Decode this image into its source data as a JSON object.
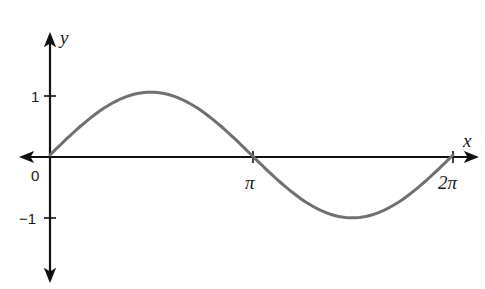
{
  "chart_data": {
    "type": "line",
    "title": "",
    "xlabel": "x",
    "ylabel": "y",
    "x_ticks": [
      {
        "value": 0,
        "label": "0"
      },
      {
        "value": 3.14159,
        "label": "π"
      },
      {
        "value": 6.28319,
        "label": "2π"
      }
    ],
    "y_ticks": [
      {
        "value": 1,
        "label": "1"
      },
      {
        "value": -1,
        "label": "−1"
      }
    ],
    "xlim": [
      0,
      6.28319
    ],
    "ylim": [
      -1.1,
      1.1
    ],
    "grid": false,
    "legend": null,
    "series": [
      {
        "name": "y = sin x",
        "color": "#707070",
        "x": [
          0,
          0.785,
          1.571,
          2.356,
          3.142,
          3.927,
          4.712,
          5.498,
          6.283
        ],
        "y": [
          0,
          0.707,
          1,
          0.707,
          0,
          -0.707,
          -1,
          -0.707,
          0
        ]
      }
    ],
    "axes_color": "#111111"
  },
  "labels": {
    "y_axis": "y",
    "x_axis": "x",
    "origin": "0",
    "y_one": "1",
    "y_neg_one": "−1",
    "x_pi": "π",
    "x_two_pi": "2π"
  }
}
